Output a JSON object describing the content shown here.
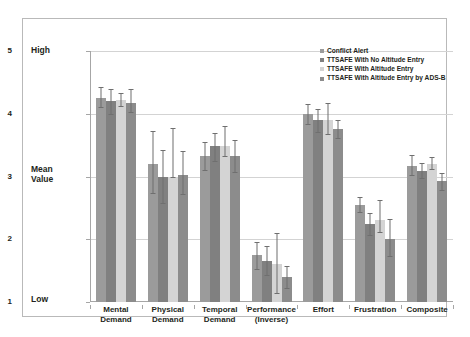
{
  "chart_data": {
    "type": "bar",
    "title": "",
    "xlabel": "",
    "ylabel": "Mean Value",
    "ylim": [
      1,
      5
    ],
    "yticks": [
      1,
      2,
      3,
      4,
      5
    ],
    "grid": true,
    "legend_position": "top-right",
    "axis_annotations": {
      "high": "High",
      "mean_value": "Mean\nValue",
      "low": "Low"
    },
    "categories": [
      "Mental\nDemand",
      "Physical\nDemand",
      "Temporal\nDemand",
      "Performance\n(Inverse)",
      "Effort",
      "Frustration",
      "Composite"
    ],
    "series": [
      {
        "name": "Conflict Alert",
        "color": "#9b9b9b",
        "values": [
          4.25,
          3.2,
          3.33,
          1.75,
          4.0,
          2.55,
          3.17
        ],
        "err_low": [
          4.1,
          2.73,
          3.1,
          1.53,
          3.84,
          2.44,
          3.02
        ],
        "err_high": [
          4.42,
          3.72,
          3.55,
          1.95,
          4.16,
          2.67,
          3.35
        ]
      },
      {
        "name": "TTSAFE With No Altitude Entry",
        "color": "#808080",
        "values": [
          4.2,
          3.0,
          3.48,
          1.66,
          3.9,
          2.25,
          3.08
        ],
        "err_low": [
          4.0,
          2.57,
          3.25,
          1.43,
          3.71,
          2.07,
          2.97
        ],
        "err_high": [
          4.4,
          3.42,
          3.7,
          1.89,
          4.08,
          2.42,
          3.22
        ]
      },
      {
        "name": "TTSAFE With Altitude Entry",
        "color": "#d4d4d4",
        "values": [
          4.22,
          3.0,
          3.48,
          1.6,
          3.9,
          2.3,
          3.2
        ],
        "err_low": [
          4.12,
          2.99,
          3.33,
          1.15,
          3.67,
          2.12,
          3.12
        ],
        "err_high": [
          4.33,
          3.77,
          3.8,
          2.1,
          4.17,
          2.62,
          3.31
        ]
      },
      {
        "name": "TTSAFE With Altitude Entry by ADS-B",
        "color": "#8c8c8c",
        "values": [
          4.17,
          3.02,
          3.32,
          1.4,
          3.75,
          2.01,
          2.93
        ],
        "err_low": [
          4.03,
          2.72,
          3.07,
          1.22,
          3.62,
          1.73,
          2.79
        ],
        "err_high": [
          4.4,
          3.4,
          3.58,
          1.58,
          3.9,
          2.33,
          3.06
        ]
      }
    ]
  },
  "legend": {
    "items": [
      {
        "label": "Conflict Alert"
      },
      {
        "label": "TTSAFE With No Altitude Entry"
      },
      {
        "label": "TTSAFE With Altitude Entry"
      },
      {
        "label": "TTSAFE With Altitude Entry by ADS-B"
      }
    ]
  }
}
